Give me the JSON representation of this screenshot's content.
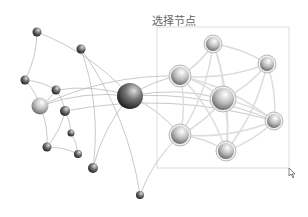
{
  "selection": {
    "label": "选择节点",
    "box": [
      157,
      27,
      289,
      168
    ]
  },
  "nodes": [
    {
      "x": 37,
      "y": 32,
      "r": 4.5,
      "type": "dark"
    },
    {
      "x": 81,
      "y": 49,
      "r": 4.5,
      "type": "dark"
    },
    {
      "x": 25,
      "y": 80,
      "r": 4.5,
      "type": "dark"
    },
    {
      "x": 56,
      "y": 90,
      "r": 4.5,
      "type": "dark"
    },
    {
      "x": 40,
      "y": 106,
      "r": 8.5,
      "type": "light"
    },
    {
      "x": 65,
      "y": 111,
      "r": 5,
      "type": "dark"
    },
    {
      "x": 71,
      "y": 133,
      "r": 3.5,
      "type": "dark"
    },
    {
      "x": 47,
      "y": 147,
      "r": 4.5,
      "type": "dark"
    },
    {
      "x": 78,
      "y": 154,
      "r": 4,
      "type": "dark"
    },
    {
      "x": 93,
      "y": 168,
      "r": 5,
      "type": "dark"
    },
    {
      "x": 140,
      "y": 195,
      "r": 4,
      "type": "dark"
    },
    {
      "x": 130,
      "y": 96,
      "r": 13,
      "type": "dark"
    },
    {
      "x": 213,
      "y": 44,
      "r": 7,
      "type": "sel"
    },
    {
      "x": 267,
      "y": 64,
      "r": 7,
      "type": "sel"
    },
    {
      "x": 180,
      "y": 76,
      "r": 9,
      "type": "sel"
    },
    {
      "x": 223,
      "y": 99,
      "r": 11,
      "type": "sel"
    },
    {
      "x": 274,
      "y": 121,
      "r": 7,
      "type": "sel"
    },
    {
      "x": 180,
      "y": 135,
      "r": 9,
      "type": "sel"
    },
    {
      "x": 226,
      "y": 151,
      "r": 8,
      "type": "sel"
    }
  ],
  "edges": [
    [
      0,
      2
    ],
    [
      0,
      11
    ],
    [
      2,
      3
    ],
    [
      2,
      4
    ],
    [
      3,
      4
    ],
    [
      3,
      5
    ],
    [
      3,
      11
    ],
    [
      4,
      7
    ],
    [
      5,
      6
    ],
    [
      5,
      7
    ],
    [
      6,
      8
    ],
    [
      7,
      8
    ],
    [
      1,
      9
    ],
    [
      9,
      11
    ],
    [
      1,
      10
    ],
    [
      10,
      17
    ],
    [
      4,
      11
    ],
    [
      11,
      14
    ],
    [
      11,
      15
    ],
    [
      11,
      16
    ],
    [
      11,
      17
    ],
    [
      4,
      14
    ],
    [
      5,
      16
    ],
    [
      12,
      13
    ],
    [
      12,
      14
    ],
    [
      12,
      15
    ],
    [
      12,
      18
    ],
    [
      12,
      17
    ],
    [
      13,
      14
    ],
    [
      13,
      15
    ],
    [
      13,
      16
    ],
    [
      13,
      18
    ],
    [
      14,
      15
    ],
    [
      14,
      16
    ],
    [
      14,
      17
    ],
    [
      14,
      18
    ],
    [
      15,
      16
    ],
    [
      15,
      17
    ],
    [
      15,
      18
    ],
    [
      16,
      17
    ],
    [
      16,
      18
    ],
    [
      17,
      18
    ]
  ]
}
